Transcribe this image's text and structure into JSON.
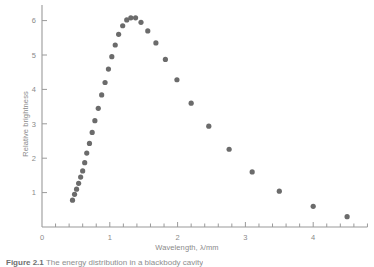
{
  "figure": {
    "caption_prefix": "Figure 2.1",
    "caption_text": "The energy distribution in a blackbody cavity"
  },
  "chart_data": {
    "type": "scatter",
    "title": "",
    "xlabel": "Wavelength, λ/mm",
    "ylabel": "Relative brightness",
    "xlim": [
      0,
      4.8
    ],
    "ylim": [
      0,
      6.45
    ],
    "xticks": [
      0,
      1,
      2,
      3,
      4
    ],
    "xtick_labels": [
      "0",
      "1",
      "2",
      "3",
      "4"
    ],
    "yticks": [
      1,
      2,
      3,
      4,
      5,
      6
    ],
    "ytick_labels": [
      "1",
      "2",
      "3",
      "4",
      "5",
      "6"
    ],
    "xminor_step": 0.2,
    "yminor_step": 1,
    "grid": false,
    "legend": null,
    "marker_color": "#6b6b6b",
    "axis_color": "#9a9a9a",
    "marker_size": 2.6,
    "x": [
      0.45,
      0.48,
      0.51,
      0.54,
      0.57,
      0.6,
      0.63,
      0.66,
      0.7,
      0.74,
      0.78,
      0.83,
      0.88,
      0.93,
      0.98,
      1.03,
      1.08,
      1.13,
      1.2,
      1.28,
      1.36,
      1.47,
      1.6,
      1.75,
      1.94,
      2.18,
      2.5,
      2.9,
      3.5,
      4.35
    ],
    "y": [
      0.78,
      0.95,
      1.1,
      1.27,
      1.45,
      1.63,
      1.87,
      2.15,
      2.43,
      2.75,
      3.09,
      3.45,
      3.84,
      4.2,
      4.59,
      4.95,
      5.29,
      5.6,
      5.85,
      6.02,
      6.08,
      6.08,
      5.95,
      5.7,
      5.35,
      4.87,
      4.28,
      3.6,
      2.93,
      2.26
    ],
    "points": [
      {
        "x": 0.45,
        "y": 0.78
      },
      {
        "x": 0.48,
        "y": 0.95
      },
      {
        "x": 0.51,
        "y": 1.1
      },
      {
        "x": 0.54,
        "y": 1.27
      },
      {
        "x": 0.57,
        "y": 1.45
      },
      {
        "x": 0.6,
        "y": 1.63
      },
      {
        "x": 0.63,
        "y": 1.87
      },
      {
        "x": 0.66,
        "y": 2.15
      },
      {
        "x": 0.7,
        "y": 2.43
      },
      {
        "x": 0.74,
        "y": 2.75
      },
      {
        "x": 0.78,
        "y": 3.09
      },
      {
        "x": 0.83,
        "y": 3.45
      },
      {
        "x": 0.88,
        "y": 3.84
      },
      {
        "x": 0.93,
        "y": 4.2
      },
      {
        "x": 0.98,
        "y": 4.59
      },
      {
        "x": 1.03,
        "y": 4.95
      },
      {
        "x": 1.08,
        "y": 5.29
      },
      {
        "x": 1.13,
        "y": 5.6
      },
      {
        "x": 1.19,
        "y": 5.85
      },
      {
        "x": 1.25,
        "y": 6.02
      },
      {
        "x": 1.31,
        "y": 6.08
      },
      {
        "x": 1.38,
        "y": 6.08
      },
      {
        "x": 1.46,
        "y": 5.95
      },
      {
        "x": 1.56,
        "y": 5.7
      },
      {
        "x": 1.68,
        "y": 5.35
      },
      {
        "x": 1.82,
        "y": 4.87
      },
      {
        "x": 1.99,
        "y": 4.28
      },
      {
        "x": 2.2,
        "y": 3.6
      },
      {
        "x": 2.46,
        "y": 2.93
      },
      {
        "x": 2.76,
        "y": 2.26
      },
      {
        "x": 3.1,
        "y": 1.6
      },
      {
        "x": 3.5,
        "y": 1.04
      },
      {
        "x": 4.0,
        "y": 0.6
      },
      {
        "x": 4.5,
        "y": 0.3
      }
    ]
  }
}
